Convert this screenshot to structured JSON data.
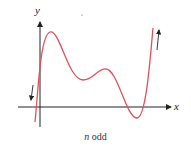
{
  "diagram": {
    "type": "polynomial-end-behavior",
    "axes": {
      "x_label": "x",
      "y_label": "y"
    },
    "caption": {
      "variable": "n",
      "text": "odd"
    },
    "curve_color": "#e0505a",
    "axis_color": "#222222",
    "curve_description": "Odd-degree polynomial: falls to -infinity on the left, rises to +infinity on the right, with two local maxima and two local minima",
    "end_behavior": {
      "left": "down",
      "right": "up"
    }
  }
}
